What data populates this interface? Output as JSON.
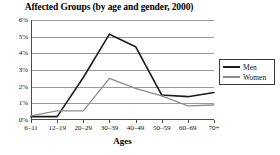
{
  "chart_data": {
    "type": "line",
    "title": "Affected Groups (by age and gender, 2000)",
    "xlabel": "Ages",
    "ylabel": "",
    "categories": [
      "6–11",
      "12–19",
      "20–29",
      "30–39",
      "40–49",
      "50–59",
      "60–69",
      "70+"
    ],
    "ylim": [
      0,
      6
    ],
    "ytick_values": [
      0,
      1,
      2,
      3,
      4,
      5,
      6
    ],
    "ytick_labels": [
      "0%",
      "1%",
      "2%",
      "3%",
      "4%",
      "5%",
      "6%"
    ],
    "grid": true,
    "legend_position": "right",
    "series": [
      {
        "name": "Men",
        "color": "#1c1c1c",
        "values": [
          0.2,
          0.2,
          2.55,
          5.15,
          4.4,
          1.5,
          1.4,
          1.65
        ]
      },
      {
        "name": "Women",
        "color": "#8d8d8d",
        "values": [
          0.25,
          0.55,
          0.55,
          2.5,
          1.9,
          1.45,
          0.85,
          0.9
        ]
      }
    ]
  },
  "legend": {
    "items": [
      {
        "label": "Men"
      },
      {
        "label": "Women"
      }
    ]
  }
}
